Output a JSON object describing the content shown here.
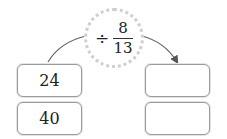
{
  "operator": {
    "symbol": "÷",
    "numerator": "8",
    "denominator": "13"
  },
  "inputs": [
    "24",
    "40"
  ],
  "outputs": [
    "",
    ""
  ],
  "colors": {
    "box_border": "#9a9a9a",
    "circle_border": "#cfcfcf",
    "arrow": "#555555"
  }
}
